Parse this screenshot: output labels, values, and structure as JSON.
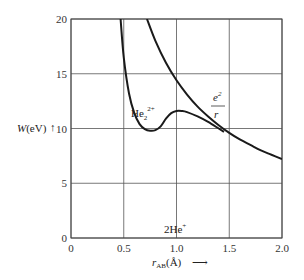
{
  "chart_data": {
    "type": "line",
    "title": "",
    "xlabel": "r_AB (Å)",
    "ylabel": "W(eV)",
    "xlim": [
      0,
      2.0
    ],
    "ylim": [
      0,
      20
    ],
    "xticks": [
      "0",
      "0.5",
      "1.0",
      "1.5",
      "2.0"
    ],
    "yticks": [
      "0",
      "5",
      "10",
      "15",
      "20"
    ],
    "grid": true,
    "series": [
      {
        "name": "e²/r",
        "x": [
          0.72,
          0.8,
          0.9,
          1.0,
          1.1,
          1.2,
          1.3,
          1.4,
          1.5,
          1.6,
          1.7,
          1.8,
          1.9,
          2.0
        ],
        "values": [
          20.0,
          18.0,
          16.0,
          14.4,
          13.1,
          12.0,
          11.1,
          10.3,
          9.6,
          9.0,
          8.5,
          8.0,
          7.6,
          7.2
        ]
      },
      {
        "name": "He₂²⁺",
        "x": [
          0.47,
          0.5,
          0.55,
          0.6,
          0.65,
          0.7,
          0.75,
          0.8,
          0.85,
          0.9,
          0.95,
          1.0,
          1.05,
          1.1,
          1.2,
          1.3,
          1.4,
          1.45
        ],
        "values": [
          20.0,
          16.5,
          13.2,
          11.4,
          10.4,
          9.95,
          9.8,
          9.85,
          10.2,
          10.9,
          11.4,
          11.6,
          11.6,
          11.5,
          11.1,
          10.6,
          10.0,
          9.7
        ]
      }
    ],
    "annotations": [
      {
        "text": "e²/r",
        "x": 1.3,
        "y": 12.5
      },
      {
        "text": "He₂²⁺",
        "x": 0.8,
        "y": 11.0
      },
      {
        "text": "2He⁺",
        "x": 1.0,
        "y": 1.0
      }
    ]
  },
  "labels": {
    "y_axis": "W(eV)",
    "y_arrow": "↑",
    "x_axis_main": "r",
    "x_axis_sub": "AB",
    "x_axis_unit": "(Å)",
    "x_arrow": "⟶",
    "ecurve_num": "e",
    "ecurve_num_sup": "2",
    "ecurve_den": "r",
    "he2_base": "He",
    "he2_sub": "2",
    "he2_sup": "2+",
    "asym": "2He",
    "asym_sup": "+"
  }
}
